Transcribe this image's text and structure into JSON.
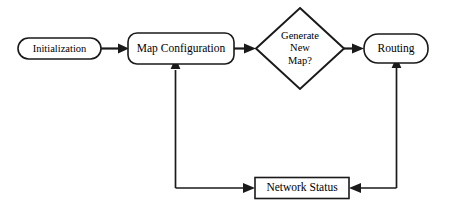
{
  "diagram": {
    "background_color": "#ffffff",
    "line_color": "#1a1a1a",
    "nodes": [
      {
        "id": "initialization",
        "label": "Initialization",
        "shape": "stadium"
      },
      {
        "id": "map-configuration",
        "label": "Map Configuration",
        "shape": "rounded-rectangle"
      },
      {
        "id": "generate-new-map",
        "label_line_1": "Generate",
        "label_line_2": "New",
        "label_line_3": "Map?",
        "shape": "diamond"
      },
      {
        "id": "routing",
        "label": "Routing",
        "shape": "stadium"
      },
      {
        "id": "network-status",
        "label": "Network Status",
        "shape": "rectangle"
      }
    ],
    "edges": [
      {
        "id": "init-to-mapcfg",
        "from": "initialization",
        "to": "map-configuration",
        "label": ""
      },
      {
        "id": "mapcfg-to-diamond",
        "from": "map-configuration",
        "to": "generate-new-map",
        "label": ""
      },
      {
        "id": "diamond-to-routing",
        "from": "generate-new-map",
        "to": "routing",
        "label": ""
      },
      {
        "id": "routing-to-netstatus",
        "from": "routing",
        "to": "network-status",
        "label": ""
      },
      {
        "id": "netstatus-to-mapcfg",
        "from": "network-status",
        "to": "map-configuration",
        "label": ""
      }
    ]
  }
}
